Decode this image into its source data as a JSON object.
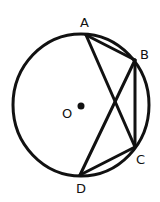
{
  "diagram": {
    "type": "circle-geometry",
    "circle": {
      "cx": 81,
      "cy": 105,
      "rx": 68,
      "ry": 71,
      "stroke": "#111111"
    },
    "center": {
      "label": "O",
      "x": 81,
      "y": 106,
      "label_x": 62,
      "label_y": 118
    },
    "points": [
      {
        "label": "A",
        "x": 86,
        "y": 35,
        "label_x": 80,
        "label_y": 27
      },
      {
        "label": "B",
        "x": 135,
        "y": 60,
        "label_x": 140,
        "label_y": 59
      },
      {
        "label": "C",
        "x": 135,
        "y": 147,
        "label_x": 136,
        "label_y": 164
      },
      {
        "label": "D",
        "x": 80,
        "y": 175,
        "label_x": 76,
        "label_y": 193
      }
    ],
    "segments": [
      [
        "A",
        "B"
      ],
      [
        "A",
        "C"
      ],
      [
        "B",
        "C"
      ],
      [
        "B",
        "D"
      ],
      [
        "C",
        "D"
      ]
    ]
  }
}
